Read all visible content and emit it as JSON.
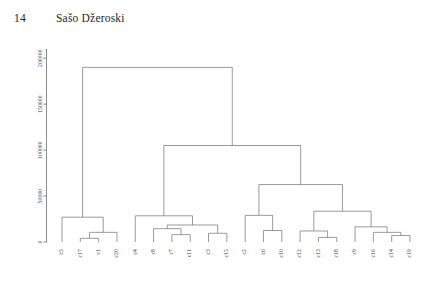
{
  "header": {
    "page_number": "14",
    "author": "Sašo Džeroski"
  },
  "chart_data": {
    "type": "line",
    "chart_kind": "dendrogram",
    "title": "",
    "xlabel": "",
    "ylabel": "",
    "grid": false,
    "legend": false,
    "yaxis": {
      "ticks": [
        0,
        50000,
        100000,
        150000,
        200000
      ],
      "tick_labels": [
        "0",
        "50000",
        "100000",
        "150000",
        "200000"
      ],
      "ylim": [
        0,
        210000
      ],
      "label_rotation": -90
    },
    "leaves": [
      "c5",
      "c17",
      "c1",
      "c20",
      "c4",
      "c8",
      "c7",
      "c11",
      "c3",
      "c15",
      "c2",
      "c6",
      "c10",
      "c12",
      "c13",
      "c18",
      "c9",
      "c16",
      "c14",
      "c19"
    ],
    "leaf_label_rotation": -90,
    "merges": [
      {
        "id": "m1",
        "left": "c17",
        "right": "c1",
        "height": 4000
      },
      {
        "id": "m2",
        "left": "m1",
        "right": "c20",
        "height": 10500
      },
      {
        "id": "m3",
        "left": "c5",
        "right": "m2",
        "height": 27000
      },
      {
        "id": "m4",
        "left": "c7",
        "right": "c11",
        "height": 8000
      },
      {
        "id": "m5",
        "left": "c8",
        "right": "m4",
        "height": 14500
      },
      {
        "id": "m6",
        "left": "c3",
        "right": "c15",
        "height": 9500
      },
      {
        "id": "m7",
        "left": "m5",
        "right": "m6",
        "height": 18500
      },
      {
        "id": "m8",
        "left": "c4",
        "right": "m7",
        "height": 28500
      },
      {
        "id": "m9",
        "left": "c6",
        "right": "c10",
        "height": 12500
      },
      {
        "id": "m10",
        "left": "c2",
        "right": "m9",
        "height": 29000
      },
      {
        "id": "m11",
        "left": "c13",
        "right": "c18",
        "height": 5000
      },
      {
        "id": "m12",
        "left": "c12",
        "right": "m11",
        "height": 12000
      },
      {
        "id": "m13",
        "left": "c14",
        "right": "c19",
        "height": 7000
      },
      {
        "id": "m14",
        "left": "c16",
        "right": "m13",
        "height": 10500
      },
      {
        "id": "m15",
        "left": "c9",
        "right": "m14",
        "height": 16500
      },
      {
        "id": "m16",
        "left": "m12",
        "right": "m15",
        "height": 33500
      },
      {
        "id": "m17",
        "left": "m10",
        "right": "m16",
        "height": 62500
      },
      {
        "id": "m18",
        "left": "m8",
        "right": "m17",
        "height": 105000
      },
      {
        "id": "m19",
        "left": "m3",
        "right": "m18",
        "height": 190000
      }
    ],
    "colors": {
      "line": "#7a7a7a",
      "axis": "#6e6e6e",
      "text": "#3a3a3a",
      "background": "#ffffff"
    }
  }
}
